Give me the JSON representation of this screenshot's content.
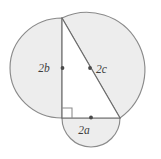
{
  "figure": {
    "type": "geometry-diagram",
    "background_color": "#ffffff",
    "shape_fill_color": "#ededed",
    "shape_stroke_color": "#8a8a8a",
    "line_color": "#6b6b6b",
    "label_color": "#3d3d3d",
    "triangle_fill_color": "#ffffff",
    "labels": {
      "vertical_leg": "2b",
      "hypotenuse": "2c",
      "horizontal_leg": "2a"
    },
    "label_positions": {
      "vertical_leg": {
        "x": 44,
        "y": 69
      },
      "hypotenuse": {
        "x": 96,
        "y": 70
      },
      "horizontal_leg": {
        "x": 83,
        "y": 131
      }
    },
    "vertices": {
      "top": {
        "x": 62,
        "y": 18
      },
      "right_angle": {
        "x": 62,
        "y": 118
      },
      "bottom_right": {
        "x": 120,
        "y": 118
      }
    },
    "midpoint_dots": {
      "vertical_leg": {
        "x": 62,
        "y": 68
      },
      "hypotenuse": {
        "x": 91,
        "y": 68
      },
      "horizontal_leg": {
        "x": 91,
        "y": 118
      }
    },
    "right_angle_marker": {
      "size": 9,
      "description": "square marker at right-angle vertex"
    },
    "semicircles": [
      {
        "name": "semicircle-on-vertical-leg",
        "on_side": "2b",
        "center": {
          "x": 62,
          "y": 68
        },
        "radius": 54,
        "bulge": "left"
      },
      {
        "name": "semicircle-on-hypotenuse",
        "on_side": "2c",
        "center": {
          "x": 91,
          "y": 68
        },
        "radius": 58,
        "bulge": "right"
      },
      {
        "name": "semicircle-on-horizontal-leg",
        "on_side": "2a",
        "center": {
          "x": 91,
          "y": 118
        },
        "radius": 29,
        "bulge": "down"
      }
    ]
  }
}
